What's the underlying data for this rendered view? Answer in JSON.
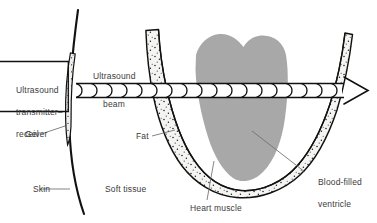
{
  "figure": {
    "kind": "ultrasound-scan-diagram",
    "background_color": "#ffffff",
    "text_color": "#3b3b3b",
    "ink_color": "#111111",
    "ventricle_fill": "#a8a8a8",
    "tissue_fill": "#f2f2f0"
  },
  "labels": {
    "transmitter_line1": "Ultrasound",
    "transmitter_line2": "transmitter–",
    "transmitter_line3": "receiver",
    "beam_line1": "Ultrasound",
    "beam_line2": "beam",
    "gel": "Gel",
    "skin": "Skin",
    "soft_tissue": "Soft tissue",
    "fat": "Fat",
    "heart_muscle": "Heart muscle",
    "ventricle_line1": "Blood-filled",
    "ventricle_line2": "ventricle"
  },
  "parts": {
    "transmitter_box": "Ultrasound transmitter–receiver",
    "gel_layer": "Gel",
    "skin_boundary": "Skin",
    "soft_tissue_region": "Soft tissue",
    "fat_layer": "Fat",
    "heart_muscle_wall": "Heart muscle",
    "ventricle_cavity": "Blood-filled ventricle",
    "beam_arrow": "Ultrasound beam"
  }
}
